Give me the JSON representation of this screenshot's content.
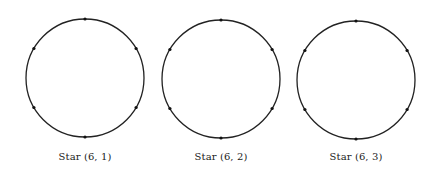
{
  "figures": [
    {
      "label": "Star (6, 1)",
      "n": 6,
      "k": 1,
      "cx": 85,
      "cy": 78,
      "r": 59
    },
    {
      "label": "Star (6, 2)",
      "n": 6,
      "k": 2,
      "cx": 221,
      "cy": 79,
      "r": 59
    },
    {
      "label": "Star (6, 3)",
      "n": 6,
      "k": 3,
      "cx": 356,
      "cy": 80,
      "r": 59
    }
  ],
  "style": {
    "stroke": "#222222",
    "dot": "#111111"
  }
}
